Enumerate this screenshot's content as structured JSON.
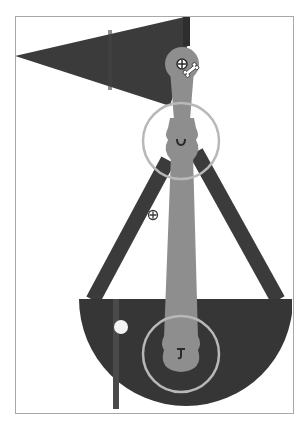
{
  "canvas": {
    "width": 307,
    "height": 425,
    "frame": {
      "x": 15,
      "y": 16,
      "w": 277,
      "h": 396
    }
  },
  "colors": {
    "background": "#ffffff",
    "frame_border": "#a8a8a8",
    "dark_shape": "#3b3b3b",
    "dark_stripe": "#2e2e2e",
    "bowl_stripe": "#4a4a4a",
    "bone": "#8e8e8e",
    "joint_ring": "#b5b5b5",
    "highlight_dot": "#f4f4f4",
    "glyph_dark": "#2a2a2a"
  },
  "scene": {
    "flag_triangle": {
      "points": "15,56 189,16 189,40 170,106"
    },
    "legs": [
      {
        "name": "left-leg",
        "from": [
          168,
          160
        ],
        "to": [
          92,
          300
        ],
        "width": 15
      },
      {
        "name": "right-leg",
        "from": [
          196,
          150
        ],
        "to": [
          278,
          300
        ],
        "width": 15
      }
    ],
    "bowl": {
      "cx": 186,
      "cy": 299,
      "r": 107
    },
    "bowl_highlight": {
      "cx": 121,
      "cy": 327,
      "r": 7
    },
    "bones": [
      {
        "name": "upper-bone",
        "head": [
          182,
          64
        ],
        "head_r": 17,
        "tail": [
          181,
          142
        ]
      },
      {
        "name": "lower-bone",
        "top": [
          182,
          150
        ],
        "bottom_head": [
          181,
          353
        ],
        "head_r": 17
      }
    ],
    "joint_rings": [
      {
        "name": "upper-joint-ring",
        "cx": 181,
        "cy": 141,
        "r": 38
      },
      {
        "name": "lower-joint-ring",
        "cx": 181,
        "cy": 354,
        "r": 38
      }
    ],
    "handles": [
      {
        "name": "move-handle",
        "cx": 182,
        "cy": 64,
        "glyph": "⊕"
      },
      {
        "name": "add-point-handle",
        "cx": 153,
        "cy": 215,
        "glyph": "⊕"
      }
    ],
    "cursor": {
      "name": "bone-tool-cursor",
      "x": 190,
      "y": 70
    }
  }
}
